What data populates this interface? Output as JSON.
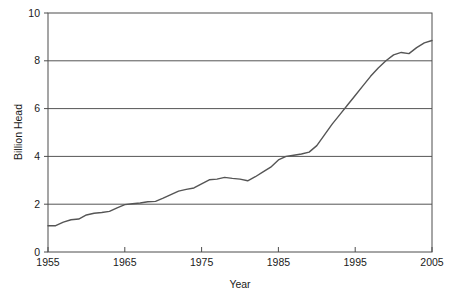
{
  "chart_data": {
    "type": "line",
    "title": "",
    "xlabel": "Year",
    "ylabel": "Billion Head",
    "xlim": [
      1955,
      2005
    ],
    "ylim": [
      0,
      10
    ],
    "grid": true,
    "legend": null,
    "xticks": [
      1955,
      1965,
      1975,
      1985,
      1995,
      2005
    ],
    "yticks": [
      0,
      2,
      4,
      6,
      8,
      10
    ],
    "xtick_labels": [
      "1955",
      "1965",
      "1975",
      "1985",
      "1995",
      "2005"
    ],
    "ytick_labels": [
      "0",
      "2",
      "4",
      "6",
      "8",
      "10"
    ],
    "series": [
      {
        "name": "Billion Head",
        "color": "#555555",
        "x": [
          1955,
          1956,
          1957,
          1958,
          1959,
          1960,
          1961,
          1962,
          1963,
          1964,
          1965,
          1966,
          1967,
          1968,
          1969,
          1970,
          1971,
          1972,
          1973,
          1974,
          1975,
          1976,
          1977,
          1978,
          1979,
          1980,
          1981,
          1982,
          1983,
          1984,
          1985,
          1986,
          1987,
          1988,
          1989,
          1990,
          1991,
          1992,
          1993,
          1994,
          1995,
          1996,
          1997,
          1998,
          1999,
          2000,
          2001,
          2002,
          2003,
          2004,
          2005
        ],
        "y": [
          1.1,
          1.1,
          1.25,
          1.35,
          1.38,
          1.55,
          1.62,
          1.65,
          1.7,
          1.85,
          1.98,
          2.02,
          2.05,
          2.1,
          2.12,
          2.25,
          2.4,
          2.55,
          2.62,
          2.68,
          2.85,
          3.02,
          3.05,
          3.12,
          3.08,
          3.05,
          2.98,
          3.15,
          3.35,
          3.55,
          3.85,
          4.0,
          4.05,
          4.1,
          4.18,
          4.45,
          4.9,
          5.35,
          5.75,
          6.15,
          6.55,
          6.95,
          7.35,
          7.7,
          8.0,
          8.25,
          8.35,
          8.3,
          8.55,
          8.75,
          8.85
        ]
      }
    ]
  },
  "axes": {
    "y_title": "Billion Head",
    "x_title": "Year"
  }
}
